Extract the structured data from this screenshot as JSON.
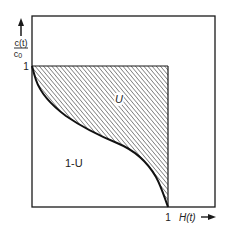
{
  "diagram": {
    "y_axis": {
      "label_numerator": "c(t)",
      "label_denominator": "c",
      "label_denominator_sub": "0",
      "tick_label": "1"
    },
    "x_axis": {
      "label": "H(t)",
      "tick_label": "1"
    },
    "regions": {
      "upper_label": "U",
      "lower_label": "1-U"
    },
    "colors": {
      "line": "#1a1a1a",
      "hatch": "#333333",
      "background": "#ffffff"
    }
  }
}
